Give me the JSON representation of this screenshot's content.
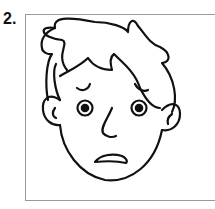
{
  "item": {
    "number_label": "2.",
    "image": {
      "subject": "worried-boy-face",
      "description": "Line drawing of a boy's face with a worried/scared expression"
    }
  }
}
